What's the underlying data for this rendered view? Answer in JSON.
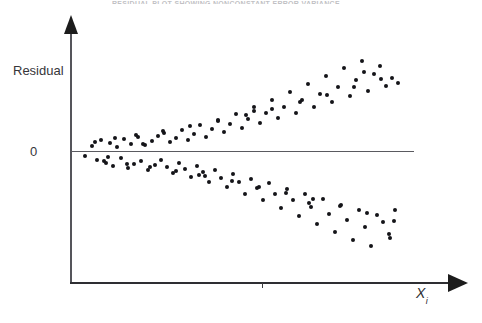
{
  "figure": {
    "title_clipped": "RESIDUAL PLOT SHOWING NONCONSTANT ERROR VARIANCE",
    "y_axis_label": "Residual",
    "y_zero_label": "0",
    "x_axis_label_base": "X",
    "x_axis_label_sub": "i",
    "ink_color": "#141418",
    "axis_color": "#2e2e32",
    "zero_line_color": "#5a5a60",
    "background_color": "#ffffff"
  },
  "chart_data": {
    "type": "scatter",
    "title": "RESIDUAL PLOT SHOWING NONCONSTANT ERROR VARIANCE",
    "xlabel": "Xi",
    "ylabel": "Residual",
    "grid": false,
    "legend": null,
    "reference_lines": [
      {
        "axis": "y",
        "value": 0,
        "label": "0"
      }
    ],
    "axis_px": {
      "x_origin": 71,
      "y_zero": 152,
      "x_end": 466,
      "y_top": 17,
      "y_baseline": 283,
      "x_tick": 262
    },
    "x": [
      85,
      92,
      97,
      101,
      106,
      110,
      113,
      117,
      121,
      124,
      128,
      131,
      134,
      138,
      141,
      145,
      148,
      152,
      155,
      158,
      161,
      164,
      167,
      170,
      173,
      176,
      179,
      182,
      185,
      188,
      191,
      194,
      197,
      200,
      203,
      206,
      209,
      212,
      215,
      218,
      221,
      224,
      227,
      230,
      233,
      236,
      239,
      242,
      245,
      248,
      251,
      254,
      257,
      260,
      263,
      266,
      269,
      272,
      275,
      278,
      281,
      284,
      287,
      290,
      293,
      296,
      299,
      302,
      305,
      308,
      311,
      314,
      317,
      320,
      323,
      326,
      329,
      332,
      335,
      338,
      341,
      344,
      347,
      350,
      353,
      356,
      359,
      362,
      365,
      368,
      371,
      374,
      377,
      380,
      383,
      386,
      389,
      392,
      395,
      398,
      95,
      104,
      115,
      127,
      136,
      150,
      163,
      176,
      190,
      205,
      218,
      232,
      246,
      259,
      272,
      286,
      300,
      313,
      327,
      340,
      354,
      367,
      381,
      394,
      108,
      143,
      199,
      254,
      309,
      364,
      390
    ],
    "y": [
      -4,
      6,
      -8,
      12,
      -11,
      9,
      -14,
      5,
      -6,
      13,
      -16,
      8,
      -12,
      15,
      -9,
      7,
      -18,
      11,
      -13,
      16,
      -8,
      19,
      -15,
      10,
      -21,
      14,
      -11,
      22,
      -17,
      12,
      -25,
      18,
      -14,
      27,
      -20,
      15,
      -30,
      23,
      -18,
      32,
      -26,
      20,
      -35,
      28,
      -22,
      38,
      -30,
      24,
      -42,
      33,
      -27,
      45,
      -36,
      29,
      -48,
      39,
      -31,
      52,
      -42,
      34,
      -56,
      45,
      -37,
      60,
      -48,
      39,
      -64,
      52,
      -42,
      68,
      -55,
      45,
      -72,
      58,
      -47,
      76,
      -62,
      50,
      -80,
      65,
      -53,
      84,
      -68,
      56,
      -88,
      72,
      -58,
      91,
      -75,
      61,
      -94,
      78,
      -63,
      86,
      -70,
      66,
      -82,
      74,
      -58,
      69,
      10,
      -9,
      14,
      -12,
      17,
      -15,
      21,
      -19,
      26,
      -24,
      31,
      -29,
      37,
      -35,
      43,
      -41,
      50,
      -47,
      57,
      -54,
      65,
      -61,
      73,
      -69,
      -5,
      8,
      -23,
      41,
      -51,
      80,
      -86
    ],
    "xlim_px": [
      71,
      413
    ],
    "ylim_px": [
      40,
      240
    ],
    "n_points": 131
  }
}
